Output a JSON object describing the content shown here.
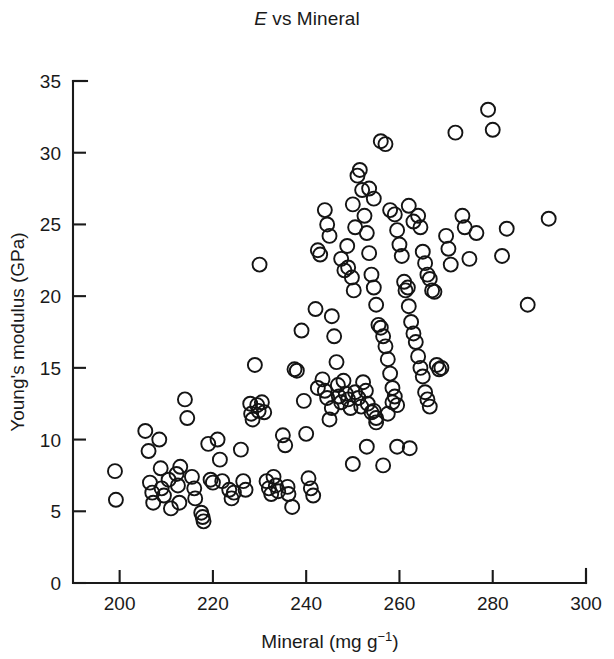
{
  "figure": {
    "title_prefix": "E",
    "title_rest": " vs Mineral",
    "background_color": "#ffffff",
    "ink_color": "#1a1a1a"
  },
  "chart_data": {
    "type": "scatter",
    "title": "E vs Mineral",
    "xlabel": "Mineral (mg g−1)",
    "ylabel": "Young's modulus (GPa)",
    "xlim": [
      190,
      300
    ],
    "ylim": [
      0,
      35
    ],
    "xticks": [
      200,
      220,
      240,
      260,
      280,
      300
    ],
    "xtick_labels": [
      "200",
      "220",
      "240",
      "260",
      "280",
      "300"
    ],
    "yticks": [
      0,
      5,
      10,
      15,
      20,
      25,
      30,
      35
    ],
    "ytick_labels": [
      "0",
      "5",
      "10",
      "15",
      "20",
      "25",
      "30",
      "35"
    ],
    "grid": false,
    "legend": null,
    "marker": {
      "shape": "open-circle",
      "radius_px": 7,
      "edge_color": "#141414",
      "fill": "none"
    },
    "n_points": 178,
    "points": [
      [
        199.0,
        7.8
      ],
      [
        199.2,
        5.8
      ],
      [
        205.5,
        10.6
      ],
      [
        206.2,
        9.2
      ],
      [
        206.5,
        7.0
      ],
      [
        207.0,
        6.3
      ],
      [
        207.2,
        5.6
      ],
      [
        208.5,
        10.0
      ],
      [
        208.8,
        8.0
      ],
      [
        209.0,
        6.6
      ],
      [
        209.5,
        6.1
      ],
      [
        210.5,
        7.2
      ],
      [
        211.0,
        5.2
      ],
      [
        212.2,
        7.6
      ],
      [
        212.5,
        6.8
      ],
      [
        212.8,
        5.6
      ],
      [
        213.0,
        8.1
      ],
      [
        214.0,
        12.8
      ],
      [
        214.5,
        11.5
      ],
      [
        215.5,
        7.4
      ],
      [
        216.0,
        6.6
      ],
      [
        216.2,
        5.9
      ],
      [
        217.5,
        4.9
      ],
      [
        217.8,
        4.6
      ],
      [
        218.0,
        4.3
      ],
      [
        219.0,
        9.7
      ],
      [
        219.5,
        7.2
      ],
      [
        220.0,
        7.0
      ],
      [
        221.0,
        10.0
      ],
      [
        221.5,
        8.6
      ],
      [
        222.0,
        7.1
      ],
      [
        223.5,
        6.5
      ],
      [
        224.0,
        5.9
      ],
      [
        224.5,
        6.3
      ],
      [
        226.0,
        9.3
      ],
      [
        226.5,
        7.1
      ],
      [
        227.0,
        6.5
      ],
      [
        228.0,
        12.5
      ],
      [
        228.2,
        11.8
      ],
      [
        228.5,
        11.4
      ],
      [
        229.0,
        15.2
      ],
      [
        229.5,
        12.4
      ],
      [
        229.8,
        12.0
      ],
      [
        230.0,
        22.2
      ],
      [
        230.5,
        12.6
      ],
      [
        231.0,
        11.9
      ],
      [
        231.5,
        7.1
      ],
      [
        232.0,
        6.6
      ],
      [
        232.5,
        6.2
      ],
      [
        233.0,
        7.4
      ],
      [
        233.5,
        6.8
      ],
      [
        234.0,
        6.4
      ],
      [
        235.0,
        10.3
      ],
      [
        235.5,
        9.6
      ],
      [
        236.0,
        6.7
      ],
      [
        236.2,
        6.2
      ],
      [
        237.0,
        5.3
      ],
      [
        237.5,
        14.9
      ],
      [
        238.0,
        14.8
      ],
      [
        239.0,
        17.6
      ],
      [
        239.5,
        12.7
      ],
      [
        240.0,
        10.4
      ],
      [
        240.5,
        7.3
      ],
      [
        241.0,
        6.6
      ],
      [
        241.5,
        6.1
      ],
      [
        242.0,
        19.1
      ],
      [
        242.5,
        23.2
      ],
      [
        243.0,
        22.9
      ],
      [
        244.0,
        26.0
      ],
      [
        244.5,
        25.0
      ],
      [
        245.0,
        24.2
      ],
      [
        245.5,
        18.6
      ],
      [
        246.0,
        17.2
      ],
      [
        246.5,
        15.4
      ],
      [
        246.8,
        13.8
      ],
      [
        247.0,
        13.0
      ],
      [
        247.5,
        12.6
      ],
      [
        248.0,
        14.1
      ],
      [
        248.5,
        13.2
      ],
      [
        249.0,
        12.8
      ],
      [
        249.5,
        12.2
      ],
      [
        250.0,
        8.3
      ],
      [
        250.5,
        24.8
      ],
      [
        251.0,
        28.4
      ],
      [
        251.5,
        28.8
      ],
      [
        252.0,
        27.4
      ],
      [
        252.5,
        25.6
      ],
      [
        253.0,
        24.4
      ],
      [
        253.5,
        23.0
      ],
      [
        254.0,
        21.5
      ],
      [
        254.5,
        20.6
      ],
      [
        255.0,
        19.4
      ],
      [
        255.5,
        18.0
      ],
      [
        256.0,
        17.8
      ],
      [
        256.5,
        17.2
      ],
      [
        257.0,
        16.5
      ],
      [
        257.5,
        15.6
      ],
      [
        258.0,
        14.6
      ],
      [
        258.5,
        13.6
      ],
      [
        259.0,
        13.0
      ],
      [
        259.5,
        12.4
      ],
      [
        250.5,
        13.3
      ],
      [
        251.2,
        12.9
      ],
      [
        251.8,
        12.3
      ],
      [
        252.2,
        14.0
      ],
      [
        252.8,
        13.4
      ],
      [
        253.2,
        12.5
      ],
      [
        254.0,
        11.9
      ],
      [
        254.5,
        12.0
      ],
      [
        255.0,
        11.5
      ],
      [
        249.0,
        22.0
      ],
      [
        249.8,
        21.3
      ],
      [
        250.2,
        20.4
      ],
      [
        247.5,
        22.6
      ],
      [
        248.2,
        21.8
      ],
      [
        248.8,
        23.5
      ],
      [
        243.5,
        14.2
      ],
      [
        244.0,
        13.4
      ],
      [
        244.5,
        12.9
      ],
      [
        245.0,
        11.4
      ],
      [
        245.5,
        12.2
      ],
      [
        242.5,
        13.6
      ],
      [
        256.0,
        30.8
      ],
      [
        257.0,
        30.6
      ],
      [
        258.0,
        26.0
      ],
      [
        259.0,
        25.7
      ],
      [
        259.5,
        24.6
      ],
      [
        260.0,
        23.6
      ],
      [
        260.5,
        22.8
      ],
      [
        261.0,
        21.0
      ],
      [
        261.3,
        20.4
      ],
      [
        261.8,
        20.6
      ],
      [
        262.0,
        19.3
      ],
      [
        262.5,
        18.2
      ],
      [
        263.0,
        17.4
      ],
      [
        263.5,
        16.8
      ],
      [
        264.0,
        15.8
      ],
      [
        264.5,
        15.0
      ],
      [
        265.0,
        14.4
      ],
      [
        265.5,
        13.3
      ],
      [
        266.0,
        12.8
      ],
      [
        266.5,
        12.3
      ],
      [
        262.2,
        9.4
      ],
      [
        259.5,
        9.5
      ],
      [
        256.5,
        8.2
      ],
      [
        253.0,
        9.5
      ],
      [
        255.0,
        11.2
      ],
      [
        257.5,
        11.8
      ],
      [
        258.5,
        12.6
      ],
      [
        264.0,
        25.6
      ],
      [
        264.5,
        24.8
      ],
      [
        265.0,
        23.1
      ],
      [
        265.5,
        22.3
      ],
      [
        266.0,
        21.5
      ],
      [
        266.5,
        21.2
      ],
      [
        267.0,
        20.4
      ],
      [
        267.5,
        20.3
      ],
      [
        268.0,
        15.2
      ],
      [
        268.5,
        14.9
      ],
      [
        269.0,
        15.0
      ],
      [
        270.0,
        24.2
      ],
      [
        270.5,
        23.3
      ],
      [
        271.0,
        22.2
      ],
      [
        272.0,
        31.4
      ],
      [
        273.5,
        25.6
      ],
      [
        274.0,
        24.8
      ],
      [
        275.0,
        22.6
      ],
      [
        276.5,
        24.4
      ],
      [
        279.0,
        33.0
      ],
      [
        280.0,
        31.6
      ],
      [
        282.0,
        22.8
      ],
      [
        283.0,
        24.7
      ],
      [
        287.5,
        19.4
      ],
      [
        292.0,
        25.4
      ],
      [
        253.5,
        27.5
      ],
      [
        254.5,
        26.8
      ],
      [
        250.0,
        26.4
      ],
      [
        262.0,
        26.3
      ],
      [
        263.0,
        25.2
      ]
    ]
  }
}
